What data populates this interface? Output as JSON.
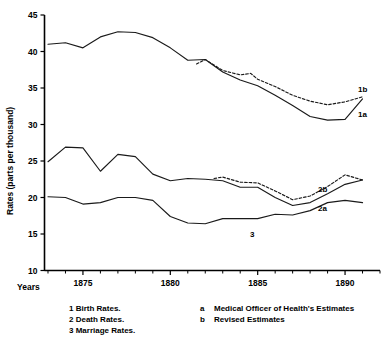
{
  "chart_data": {
    "type": "line",
    "title": "",
    "xlabel": "Years",
    "ylabel": "Rates (parts per thousand)",
    "xlim": [
      1872.8,
      1892.0
    ],
    "ylim": [
      10,
      45
    ],
    "grid": false,
    "legend_position": "below-plot",
    "y_ticks": [
      10,
      15,
      20,
      25,
      30,
      35,
      40,
      45
    ],
    "x_ticks": [
      1875,
      1880,
      1885,
      1890
    ],
    "x_minor_tick_interval": 1,
    "series": [
      {
        "name": "1a",
        "label": "1a",
        "description": "Birth Rates - Medical Officer of Health's Estimates",
        "style": "solid",
        "x": [
          1873.0,
          1874.0,
          1875.0,
          1876.0,
          1877.0,
          1878.0,
          1879.0,
          1880.0,
          1881.0,
          1882.0,
          1883.0,
          1884.0,
          1885.0,
          1886.0,
          1887.0,
          1888.0,
          1889.0,
          1890.0,
          1891.0
        ],
        "values": [
          41.0,
          41.2,
          40.5,
          42.0,
          42.7,
          42.6,
          41.9,
          40.5,
          38.8,
          38.9,
          37.2,
          36.1,
          35.3,
          34.0,
          32.6,
          31.1,
          30.6,
          30.7,
          33.5
        ]
      },
      {
        "name": "1b",
        "label": "1b",
        "description": "Birth Rates - Revised Estimates",
        "style": "dashed",
        "x": [
          1881.5,
          1882.0,
          1883.0,
          1884.0,
          1884.6,
          1885.0,
          1886.0,
          1887.0,
          1888.0,
          1889.0,
          1890.0,
          1891.0
        ],
        "values": [
          38.3,
          38.9,
          37.4,
          36.8,
          37.0,
          36.2,
          35.2,
          34.0,
          33.2,
          32.7,
          33.1,
          33.8
        ]
      },
      {
        "name": "2a",
        "label": "2a",
        "description": "Death Rates - Medical Officer of Health's Estimates",
        "style": "solid",
        "x": [
          1873.0,
          1874.0,
          1875.0,
          1876.0,
          1877.0,
          1878.0,
          1879.0,
          1880.0,
          1881.0,
          1882.0,
          1883.0,
          1884.0,
          1885.0,
          1886.0,
          1887.0,
          1888.0,
          1889.0,
          1890.0,
          1891.0
        ],
        "values": [
          24.9,
          26.9,
          26.8,
          23.6,
          25.9,
          25.6,
          23.2,
          22.3,
          22.6,
          22.5,
          22.3,
          21.4,
          21.4,
          20.0,
          18.9,
          19.3,
          20.5,
          21.8,
          22.4
        ]
      },
      {
        "name": "2b",
        "label": "2b",
        "description": "Death Rates - Revised Estimates",
        "style": "dashed",
        "x": [
          1882.5,
          1883.0,
          1884.0,
          1885.0,
          1886.0,
          1887.0,
          1888.0,
          1889.0,
          1890.0,
          1891.0
        ],
        "values": [
          22.6,
          22.8,
          22.1,
          22.0,
          20.9,
          19.7,
          20.2,
          21.5,
          23.1,
          22.4
        ]
      },
      {
        "name": "3",
        "label": "3",
        "description": "Marriage Rates",
        "style": "solid",
        "x": [
          1873.0,
          1874.0,
          1875.0,
          1876.0,
          1877.0,
          1878.0,
          1879.0,
          1880.0,
          1881.0,
          1882.0,
          1883.0,
          1884.0,
          1885.0,
          1886.0,
          1887.0,
          1888.0,
          1889.0,
          1890.0,
          1891.0
        ],
        "values": [
          20.1,
          20.0,
          19.1,
          19.3,
          20.0,
          20.0,
          19.6,
          17.4,
          16.5,
          16.4,
          17.1,
          17.1,
          17.1,
          17.7,
          17.6,
          18.2,
          19.3,
          19.6,
          19.3
        ]
      }
    ]
  },
  "axes": {
    "y_title": "Rates (parts per thousand)",
    "x_title": "Years",
    "y_tick_labels": [
      "45",
      "40",
      "35",
      "30",
      "25",
      "20",
      "15",
      "10"
    ],
    "x_tick_labels": [
      "1875",
      "1880",
      "1885",
      "1890"
    ]
  },
  "series_annotations": {
    "label_1b": "1b",
    "label_1a": "1a",
    "label_2b": "2b",
    "label_2a": "2a",
    "label_3": "3"
  },
  "legend": {
    "left_column": [
      "1 Birth Rates.",
      "2 Death Rates.",
      "3 Marriage Rates."
    ],
    "right_column": [
      {
        "key": "a",
        "text": "Medical Officer of Health's Estimates"
      },
      {
        "key": "b",
        "text": "Revised Estimates"
      }
    ]
  }
}
